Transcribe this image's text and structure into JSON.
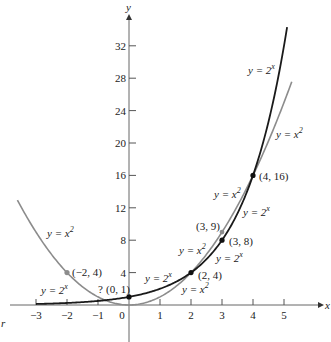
{
  "chart_data": {
    "type": "line",
    "title": "",
    "xlabel": "x",
    "ylabel": "y",
    "xlim": [
      -3.5,
      5.8
    ],
    "ylim": [
      -6,
      35
    ],
    "x_ticks": [
      -3,
      -2,
      -1,
      0,
      1,
      2,
      3,
      4,
      5
    ],
    "x_tick_labels": [
      "−3",
      "−2",
      "−1",
      "0",
      "1",
      "2",
      "3",
      "4",
      "5"
    ],
    "y_ticks": [
      4,
      8,
      12,
      16,
      20,
      24,
      28,
      32
    ],
    "y_tick_labels": [
      "4",
      "8",
      "12",
      "16",
      "20",
      "24",
      "28",
      "32"
    ],
    "grid": false,
    "series": [
      {
        "name": "y = 2^x",
        "color": "#1a1a1a",
        "x_range": [
          -3,
          5.1
        ],
        "formula": "2^x"
      },
      {
        "name": "y = x^2",
        "color": "#8a8a8a",
        "x_range": [
          -3.6,
          5.25
        ],
        "formula": "x^2"
      }
    ],
    "points": [
      {
        "label": "(−2, 4)",
        "x": -2,
        "y": 4,
        "series": "y = x^2"
      },
      {
        "label": "(0, 1)",
        "x": 0,
        "y": 1,
        "series": "y = 2^x"
      },
      {
        "label": "(2, 4)",
        "x": 2,
        "y": 4,
        "series": "both"
      },
      {
        "label": "(3, 9)",
        "x": 3,
        "y": 9,
        "series": "y = x^2"
      },
      {
        "label": "(3, 8)",
        "x": 3,
        "y": 8,
        "series": "y = 2^x"
      },
      {
        "label": "(4, 16)",
        "x": 4,
        "y": 16,
        "series": "both"
      }
    ],
    "annotations": [
      {
        "text": "?",
        "near": "(0, 1)"
      },
      {
        "text": "y = 2^x",
        "position": "upper right near top of 2^x curve"
      },
      {
        "text": "y = x^2",
        "position": "right of x^2 curve top"
      },
      {
        "text": "y = x^2",
        "position": "left branch of parabola"
      },
      {
        "text": "y = 2^x",
        "position": "left, near x = -2"
      },
      {
        "text": "y = 2^x",
        "position": "between x=0 and x=2"
      },
      {
        "text": "y = x^2",
        "position": "below (2,4)"
      },
      {
        "text": "y = x^2",
        "position": "left of (3,9)"
      },
      {
        "text": "y = 2^x",
        "position": "below (3,8)"
      },
      {
        "text": "y = x^2",
        "position": "left of x=4"
      },
      {
        "text": "y = 2^x",
        "position": "right, between 3 and 4"
      }
    ]
  },
  "labels": {
    "x_axis": "x",
    "y_axis": "y",
    "question_mark": "?",
    "stray_mark": "r",
    "curve_labels": {
      "exp_top": "y = 2",
      "sq_top": "y = x",
      "sq_left": "y = x",
      "exp_left": "y = 2",
      "exp_mid": "y = 2",
      "sq_low": "y = x",
      "sq_39": "y = x",
      "exp_38": "y = 2",
      "sq_416": "y = x",
      "exp_416": "y = 2"
    },
    "sup_x": "x",
    "sup_2": "2",
    "points": {
      "p_m2_4": "(−2, 4)",
      "p_0_1": "(0, 1)",
      "p_2_4": "(2, 4)",
      "p_3_9": "(3, 9)",
      "p_3_8": "(3, 8)",
      "p_4_16": "(4, 16)"
    },
    "xticks": [
      "−3",
      "−2",
      "−1",
      "0",
      "1",
      "2",
      "3",
      "4",
      "5"
    ],
    "yticks": [
      "4",
      "8",
      "12",
      "16",
      "20",
      "24",
      "28",
      "32"
    ]
  }
}
